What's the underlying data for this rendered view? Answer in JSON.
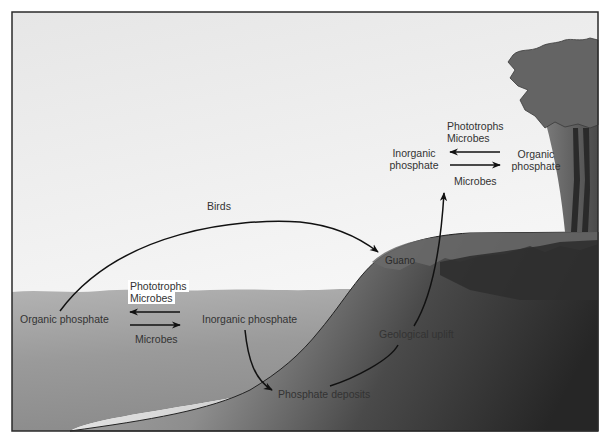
{
  "diagram": {
    "colors": {
      "frame": "#2b2b2b",
      "sky_top": "#e9e9e9",
      "sky_bottom": "#fafafa",
      "water": "#a9a9a9",
      "land_light": "#c8c8c8",
      "land_dark": "#2e2e2e",
      "tree": "#5a5a5a",
      "text": "#333333"
    },
    "labels": {
      "birds": "Birds",
      "guano": "Guano",
      "sea_phototrophs": "Phototrophs",
      "sea_microbes_top": "Microbes",
      "sea_microbes_bottom": "Microbes",
      "sea_organic": "Organic phosphate",
      "sea_inorganic": "Inorganic phosphate",
      "phosphate_deposits": "Phosphate deposits",
      "geological_uplift": "Geological uplift",
      "land_phototrophs": "Phototrophs",
      "land_microbes_top": "Microbes",
      "land_microbes_bottom": "Microbes",
      "land_inorganic_line1": "Inorganic",
      "land_inorganic_line2": "phosphate",
      "land_organic_line1": "Organic",
      "land_organic_line2": "phosphate"
    },
    "icons": {
      "arrow_left": "arrow-left-icon",
      "arrow_right": "arrow-right-icon",
      "curved_arrow": "curved-arrow-icon",
      "tree": "tree-icon"
    }
  }
}
